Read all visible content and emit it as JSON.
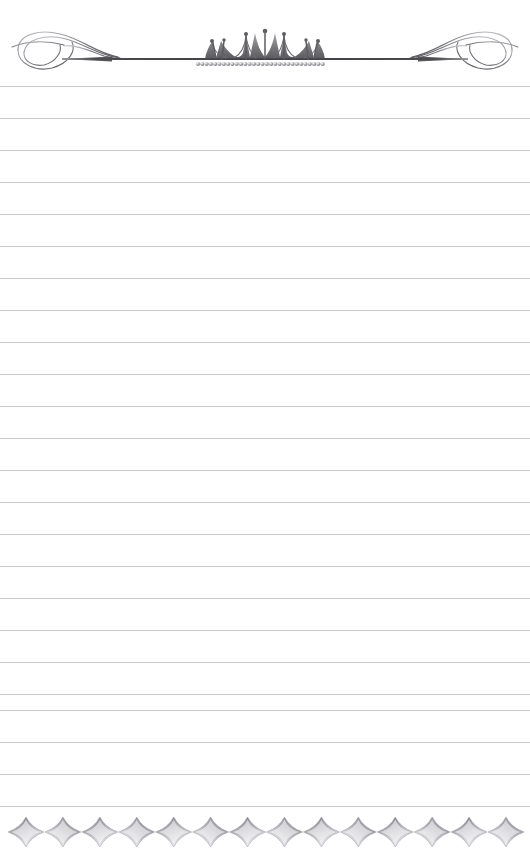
{
  "page": {
    "width": 530,
    "height": 864,
    "background_color": "#ffffff",
    "paper_type": "ruled-notepaper",
    "body_text": ""
  },
  "header": {
    "name": "crown-and-flourish-divider",
    "rule": {
      "color": "#4a4a4c",
      "y": 59,
      "x_start": 62,
      "x_end": 468,
      "thickness": 2
    },
    "crown": {
      "name": "crown-ornament",
      "color": "#6e6e72",
      "points": 5,
      "center_x": 265,
      "base_y": 59,
      "height": 32,
      "width": 120,
      "finial_dots": 5
    },
    "pearl_band": {
      "name": "pearl-band",
      "color": "#8d8d92",
      "count": 30,
      "x_start": 197,
      "x_end": 322,
      "y": 64,
      "radius": 2.1
    },
    "flourish_left": {
      "name": "scroll-flourish-left",
      "color": "#8a8a8e",
      "x": 14,
      "y": 28,
      "width": 110,
      "height": 48
    },
    "flourish_right": {
      "name": "scroll-flourish-right",
      "color": "#8a8a8e",
      "x": 406,
      "y": 28,
      "width": 110,
      "height": 48
    }
  },
  "ruled_lines": {
    "name": "writing-rules",
    "color": "#c9cbcd",
    "thickness": 1,
    "spacing": 32,
    "first_y": 86,
    "count": 24,
    "y_positions": [
      86,
      118,
      150,
      182,
      214,
      246,
      278,
      310,
      342,
      374,
      406,
      438,
      470,
      502,
      534,
      566,
      598,
      630,
      662,
      694,
      710,
      742,
      774,
      806
    ]
  },
  "footer": {
    "name": "star-chain-border",
    "description": "Horizontal chain of four-pointed concave stars",
    "color": "#9a9aa0",
    "highlight_color": "#ffffff",
    "star_count": 14,
    "x_start": 26,
    "x_end": 506,
    "center_y": 844,
    "star_width": 36,
    "star_height": 30
  }
}
